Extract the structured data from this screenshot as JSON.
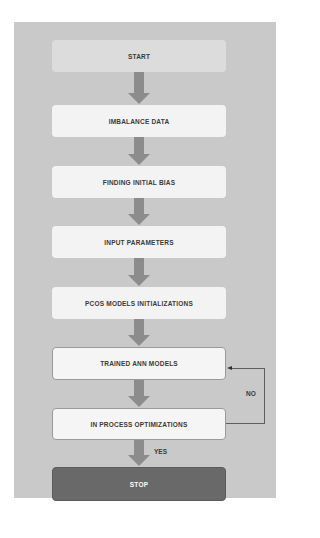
{
  "diagram": {
    "type": "flowchart",
    "nodes": [
      {
        "id": "start",
        "label": "START"
      },
      {
        "id": "imbalance",
        "label": "IMBALANCE DATA"
      },
      {
        "id": "bias",
        "label": "FINDING INITIAL BIAS"
      },
      {
        "id": "params",
        "label": "INPUT PARAMETERS"
      },
      {
        "id": "pcos",
        "label": "PCOS MODELS INITIALIZATIONS"
      },
      {
        "id": "trained",
        "label": "TRAINED ANN MODELS"
      },
      {
        "id": "optim",
        "label": "IN PROCESS OPTIMIZATIONS"
      },
      {
        "id": "stop",
        "label": "STOP"
      }
    ],
    "edges": [
      {
        "from": "start",
        "to": "imbalance"
      },
      {
        "from": "imbalance",
        "to": "bias"
      },
      {
        "from": "bias",
        "to": "params"
      },
      {
        "from": "params",
        "to": "pcos"
      },
      {
        "from": "pcos",
        "to": "trained"
      },
      {
        "from": "trained",
        "to": "optim"
      },
      {
        "from": "optim",
        "to": "stop",
        "label": "YES"
      },
      {
        "from": "optim",
        "to": "trained",
        "label": "NO"
      }
    ],
    "labels": {
      "yes": "YES",
      "no": "NO"
    },
    "colors": {
      "panel": "#c9c9c9",
      "node": "#f3f3f3",
      "start_node": "#dcdcdc",
      "stop_node": "#696969",
      "arrow": "#8c8c8c",
      "text": "#3a3a3a"
    }
  }
}
